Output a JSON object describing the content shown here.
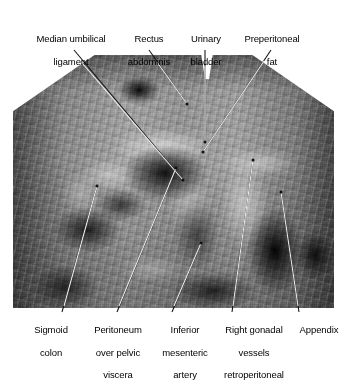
{
  "figure": {
    "type": "anatomical-photograph",
    "rendering": "grayscale photograph with leader-line annotations"
  },
  "labels_top": [
    {
      "id": "median-umbilical-ligament",
      "line1": "Median umbilical",
      "line2": "ligament",
      "text": "Median umbilical ligament"
    },
    {
      "id": "rectus-abdominis",
      "line1": "Rectus",
      "line2": "abdominis",
      "text": "Rectus abdominis"
    },
    {
      "id": "urinary-bladder",
      "line1": "Urinary",
      "line2": "bladder",
      "text": "Urinary bladder"
    },
    {
      "id": "preperitoneal-fat",
      "line1": "Preperitoneal",
      "line2": "fat",
      "text": "Preperitoneal fat"
    }
  ],
  "labels_bottom": [
    {
      "id": "sigmoid-colon",
      "line1": "Sigmoid",
      "line2": "colon",
      "line3": "",
      "text": "Sigmoid colon"
    },
    {
      "id": "peritoneum-over-pelvic-viscera",
      "line1": "Peritoneum",
      "line2": "over pelvic",
      "line3": "viscera",
      "text": "Peritoneum over pelvic viscera"
    },
    {
      "id": "inferior-mesenteric-artery",
      "line1": "Inferior",
      "line2": "mesenteric",
      "line3": "artery",
      "text": "Inferior mesenteric artery"
    },
    {
      "id": "right-gonadal-vessels-retroperitoneal",
      "line1": "Right gonadal",
      "line2": "vessels",
      "line3": "retroperitoneal",
      "text": "Right gonadal vessels retroperitoneal"
    },
    {
      "id": "appendix",
      "line1": "Appendix",
      "line2": "",
      "line3": "",
      "text": "Appendix"
    }
  ],
  "colors": {
    "background": "#ffffff",
    "text": "#000000",
    "leader_line_outside": "#000000",
    "leader_line_inside": "#ffffff"
  }
}
